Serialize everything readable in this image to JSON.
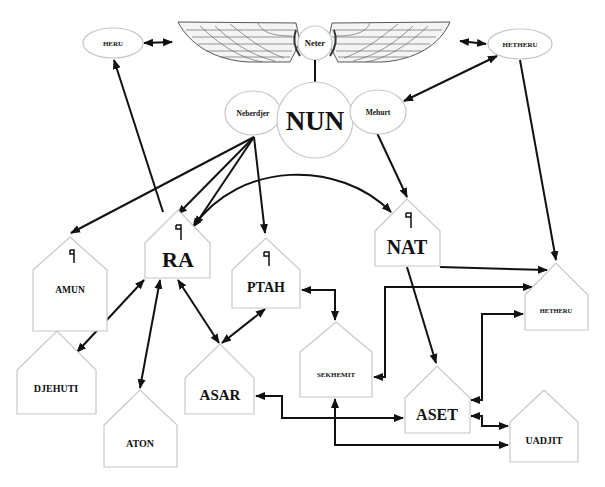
{
  "diagram": {
    "type": "relationship-diagram",
    "colors": {
      "line": "#111111",
      "shape_border": "#c8c8c8",
      "background": "#ffffff",
      "text": "#111111"
    },
    "top": {
      "winged_sun": {
        "label": "Neter",
        "icon": "winged-sun-disk"
      },
      "heru": {
        "label": "HERU"
      },
      "hetheru": {
        "label": "HETHERU"
      }
    },
    "center": {
      "nun": {
        "label": "NUN"
      },
      "neberdjer": {
        "label": "Neberdjer"
      },
      "mehurt": {
        "label": "Mehurt"
      }
    },
    "houses": {
      "amun": {
        "label": "AMUN",
        "glyph": "flag-neter-glyph"
      },
      "ra": {
        "label": "RA",
        "glyph": "flag-neter-glyph"
      },
      "ptah": {
        "label": "PTAH",
        "glyph": "flag-neter-glyph"
      },
      "nat": {
        "label": "NAT",
        "glyph": "flag-neter-glyph"
      },
      "hetheru": {
        "label": "HETHERU"
      },
      "sekhemit": {
        "label": "SEKHEMIT"
      },
      "djehuti": {
        "label": "DJEHUTI"
      },
      "aton": {
        "label": "ATON"
      },
      "asar": {
        "label": "ASAR"
      },
      "aset": {
        "label": "ASET"
      },
      "uadjit": {
        "label": "UADJIT"
      }
    },
    "edges": [
      {
        "from": "HERU",
        "to": "Neter",
        "direction": "both"
      },
      {
        "from": "Neter",
        "to": "HETHERU",
        "direction": "both"
      },
      {
        "from": "Neter",
        "to": "NUN",
        "direction": "none"
      },
      {
        "from": "HETHERU",
        "to": "Mehurt",
        "direction": "both"
      },
      {
        "from": "RA",
        "to": "HERU",
        "direction": "forward"
      },
      {
        "from": "Neberdjer",
        "to": "AMUN",
        "direction": "forward"
      },
      {
        "from": "Neberdjer",
        "to": "RA",
        "direction": "forward"
      },
      {
        "from": "Neberdjer",
        "to": "RA",
        "direction": "forward"
      },
      {
        "from": "Neberdjer",
        "to": "PTAH",
        "direction": "forward"
      },
      {
        "from": "Mehurt",
        "to": "NAT",
        "direction": "forward"
      },
      {
        "from": "HETHERU",
        "to": "HETHERU (house)",
        "direction": "forward"
      },
      {
        "from": "RA",
        "to": "NAT",
        "direction": "both"
      },
      {
        "from": "NAT",
        "to": "HETHERU (house)",
        "direction": "forward"
      },
      {
        "from": "NAT",
        "to": "ASET",
        "direction": "forward"
      },
      {
        "from": "RA",
        "to": "DJEHUTI",
        "direction": "both"
      },
      {
        "from": "RA",
        "to": "ATON",
        "direction": "both"
      },
      {
        "from": "RA",
        "to": "ASAR",
        "direction": "both"
      },
      {
        "from": "PTAH",
        "to": "ASAR",
        "direction": "both"
      },
      {
        "from": "PTAH",
        "to": "SEKHEMIT",
        "direction": "both"
      },
      {
        "from": "SEKHEMIT",
        "to": "HETHERU (house)",
        "direction": "both"
      },
      {
        "from": "ASAR",
        "to": "ASET",
        "direction": "both"
      },
      {
        "from": "SEKHEMIT",
        "to": "UADJIT",
        "direction": "both"
      },
      {
        "from": "ASET",
        "to": "HETHERU (house)",
        "direction": "both"
      },
      {
        "from": "ASET",
        "to": "UADJIT",
        "direction": "both"
      }
    ]
  }
}
